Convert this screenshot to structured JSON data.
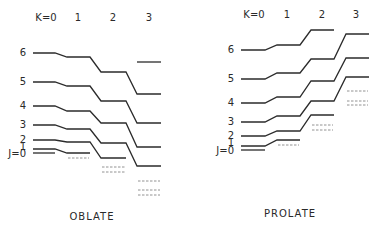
{
  "diagram": {
    "panels": [
      {
        "name": "oblate",
        "caption": "OBLATE",
        "caption_pos": [
          92,
          220
        ],
        "k_labels": [
          {
            "text": "K=0",
            "x": 46,
            "y": 21
          },
          {
            "text": "1",
            "x": 78,
            "y": 21
          },
          {
            "text": "2",
            "x": 113,
            "y": 21
          },
          {
            "text": "3",
            "x": 149,
            "y": 21
          }
        ],
        "columns": [
          [
            33,
            55
          ],
          [
            67,
            90
          ],
          [
            101,
            126
          ],
          [
            137,
            161
          ]
        ],
        "j_labels": [
          {
            "text": "6",
            "x": 26,
            "y": 56
          },
          {
            "text": "5",
            "x": 26,
            "y": 85
          },
          {
            "text": "4",
            "x": 26,
            "y": 109
          },
          {
            "text": "3",
            "x": 26,
            "y": 128
          },
          {
            "text": "2",
            "x": 26,
            "y": 143
          },
          {
            "text": "1",
            "x": 26,
            "y": 150
          },
          {
            "text": "J=0",
            "x": 26,
            "y": 157
          }
        ],
        "levels": [
          {
            "J": 6,
            "y": [
              53,
              57,
              72,
              94
            ]
          },
          {
            "J": 5,
            "y": [
              82,
              86,
              101,
              123
            ]
          },
          {
            "J": 4,
            "y": [
              106,
              111,
              123,
              147
            ]
          },
          {
            "J": 3,
            "y": [
              125,
              129,
              143,
              166
            ]
          },
          {
            "J": 2,
            "y": [
              140,
              142,
              158,
              null
            ]
          },
          {
            "J": 1,
            "y": [
              149,
              153,
              null,
              null
            ]
          },
          {
            "J": 0,
            "y": [
              153,
              null,
              null,
              null
            ]
          }
        ],
        "extra_solid": [
          {
            "K": 3,
            "y": 62
          }
        ],
        "dashed": [
          {
            "K": 1,
            "y": 158
          },
          {
            "K": 2,
            "y": 167
          },
          {
            "K": 2,
            "y": 172
          },
          {
            "K": 3,
            "y": 181
          },
          {
            "K": 3,
            "y": 190
          },
          {
            "K": 3,
            "y": 195
          }
        ]
      },
      {
        "name": "prolate",
        "caption": "PROLATE",
        "caption_pos": [
          290,
          217
        ],
        "k_labels": [
          {
            "text": "K=0",
            "x": 254,
            "y": 18
          },
          {
            "text": "1",
            "x": 287,
            "y": 18
          },
          {
            "text": "2",
            "x": 322,
            "y": 18
          },
          {
            "text": "3",
            "x": 356,
            "y": 18
          }
        ],
        "columns": [
          [
            241,
            265
          ],
          [
            277,
            300
          ],
          [
            311,
            334
          ],
          [
            346,
            369
          ]
        ],
        "j_labels": [
          {
            "text": "6",
            "x": 234,
            "y": 53
          },
          {
            "text": "5",
            "x": 234,
            "y": 82
          },
          {
            "text": "4",
            "x": 234,
            "y": 106
          },
          {
            "text": "3",
            "x": 234,
            "y": 125
          },
          {
            "text": "2",
            "x": 234,
            "y": 139
          },
          {
            "text": "1",
            "x": 234,
            "y": 146
          },
          {
            "text": "J=0",
            "x": 234,
            "y": 154
          }
        ],
        "levels": [
          {
            "J": 6,
            "y": [
              50,
              45,
              30,
              null
            ]
          },
          {
            "J": 5,
            "y": [
              79,
              73,
              59,
              34
            ]
          },
          {
            "J": 4,
            "y": [
              103,
              97,
              81,
              58
            ]
          },
          {
            "J": 3,
            "y": [
              122,
              116,
              101,
              77
            ]
          },
          {
            "J": 2,
            "y": [
              136,
              131,
              115,
              null
            ]
          },
          {
            "J": 1,
            "y": [
              146,
              140,
              null,
              null
            ]
          },
          {
            "J": 0,
            "y": [
              150,
              null,
              null,
              null
            ]
          }
        ],
        "extra_solid": [],
        "dashed": [
          {
            "K": 1,
            "y": 145
          },
          {
            "K": 2,
            "y": 125
          },
          {
            "K": 2,
            "y": 130
          },
          {
            "K": 3,
            "y": 91
          },
          {
            "K": 3,
            "y": 101
          },
          {
            "K": 3,
            "y": 105
          }
        ]
      }
    ]
  }
}
